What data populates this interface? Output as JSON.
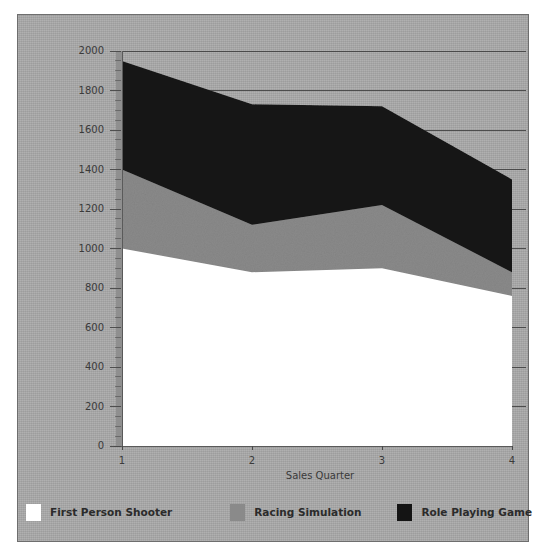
{
  "chart_data": {
    "type": "area",
    "stacked": true,
    "title": "",
    "subtitle": "",
    "xlabel": "Sales Quarter",
    "ylabel": "",
    "categories": [
      "1",
      "2",
      "3",
      "4"
    ],
    "x": [
      1,
      2,
      3,
      4
    ],
    "xtick_labels": [
      "1",
      "2",
      "3",
      "4"
    ],
    "ytick_labels": [
      "0",
      "200",
      "400",
      "600",
      "800",
      "1000",
      "1200",
      "1400",
      "1600",
      "1800",
      "2000"
    ],
    "ytick_values": [
      0,
      200,
      400,
      600,
      800,
      1000,
      1200,
      1400,
      1600,
      1800,
      2000
    ],
    "ylim": [
      0,
      2000
    ],
    "grid": "horizontal-major",
    "legend_position": "bottom",
    "series": [
      {
        "name": "First Person Shooter",
        "color": "#ffffff",
        "values": [
          1000,
          880,
          900,
          760
        ],
        "cumulative": [
          1000,
          880,
          900,
          760
        ]
      },
      {
        "name": "Racing Simulation",
        "color": "#8a8a8a",
        "values": [
          400,
          240,
          320,
          120
        ],
        "cumulative": [
          1400,
          1120,
          1220,
          880
        ]
      },
      {
        "name": "Role Playing Game",
        "color": "#141414",
        "values": [
          550,
          610,
          500,
          470
        ],
        "cumulative": [
          1950,
          1730,
          1720,
          1350
        ]
      }
    ],
    "colors": {
      "background": "#a8a8a8",
      "plot_area": "#a8a8a8",
      "axis": "#555555",
      "grid": "#3c3c3c",
      "text": "#3a3a3a",
      "frame_border": "#6e6e6e"
    }
  },
  "legend": {
    "items": [
      {
        "label": "First Person Shooter",
        "color": "#ffffff"
      },
      {
        "label": "Racing Simulation",
        "color": "#8a8a8a"
      },
      {
        "label": "Role Playing Game",
        "color": "#141414"
      }
    ]
  },
  "axes": {
    "x_title": "Sales Quarter",
    "y_title": ""
  }
}
